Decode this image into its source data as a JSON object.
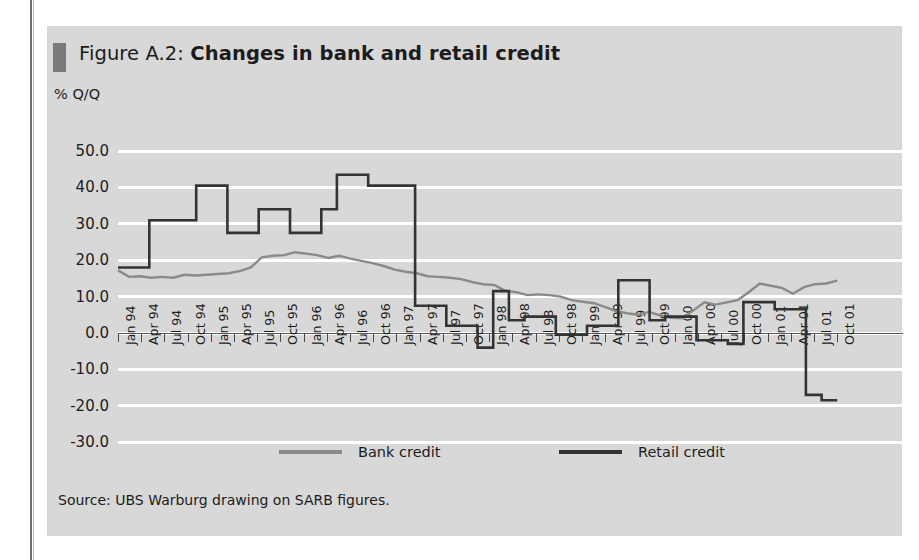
{
  "figure": {
    "label": "Figure A.2:",
    "title": "Changes in bank and retail credit",
    "y_unit": "% Q/Q",
    "source": "Source: UBS Warburg drawing on SARB figures.",
    "accent_bar_color": "#7a7a7a",
    "panel_bg": "#d8d8d8"
  },
  "legend": {
    "position": "bottom-center",
    "items": [
      {
        "label": "Bank credit",
        "color": "#8a8a8a"
      },
      {
        "label": "Retail credit",
        "color": "#333333"
      }
    ]
  },
  "chart_data": {
    "type": "line",
    "title": "Changes in bank and retail credit",
    "xlabel": "",
    "ylabel": "% Q/Q",
    "ylim": [
      -30,
      50
    ],
    "yticks": [
      "50.0",
      "40.0",
      "30.0",
      "20.0",
      "10.0",
      "0.0",
      "-10.0",
      "-20.0",
      "-30.0"
    ],
    "ytick_values": [
      50,
      40,
      30,
      20,
      10,
      0,
      -10,
      -20,
      -30
    ],
    "grid": true,
    "grid_color": "#ffffff",
    "categories": [
      "Jan 94",
      "Apr 94",
      "Jul 94",
      "Oct 94",
      "Jan 95",
      "Apr 95",
      "Jul 95",
      "Oct 95",
      "Jan 96",
      "Apr 96",
      "Jul 96",
      "Oct 96",
      "Jan 97",
      "Apr 97",
      "Jul 97",
      "Oct 97",
      "Jan 98",
      "Apr 98",
      "Jul 98",
      "Oct 98",
      "Jan 99",
      "Apr 99",
      "Jul 99",
      "Oct 99",
      "Jan 00",
      "Apr 00",
      "Jul 00",
      "Oct 00",
      "Jan 01",
      "Apr 01",
      "Jul 01",
      "Oct 01"
    ],
    "series": [
      {
        "name": "Bank credit",
        "color": "#8a8a8a",
        "values": [
          17.0,
          15.5,
          15.0,
          15.8,
          16.0,
          17.0,
          21.5,
          22.0,
          21.0,
          20.5,
          19.5,
          17.5,
          16.0,
          14.5,
          13.8,
          11.5,
          11.0,
          10.5,
          10.0,
          9.0,
          7.5,
          6.0,
          5.5,
          4.5,
          4.0,
          6.5,
          9.5,
          11.0,
          13.5,
          12.0,
          13.5,
          14.5
        ]
      },
      {
        "name": "Retail credit",
        "color": "#333333",
        "values": [
          18.0,
          18.0,
          31.0,
          31.0,
          40.5,
          27.5,
          27.5,
          27.5,
          34.0,
          34.0,
          27.5,
          34.0,
          43.5,
          40.5,
          40.5,
          40.5,
          20.5,
          7.5,
          2.0,
          2.0,
          -4.0,
          -4.0,
          11.5,
          11.5,
          3.5,
          4.5,
          4.5,
          -0.5,
          -0.5,
          2.0,
          2.0,
          2.0
        ]
      }
    ],
    "series_note": "Both lines are plotted stepwise over 32 quarterly observations from Jan 94 to Oct 01; retail credit falls sharply to about -18 at the end of 2001."
  },
  "retail_path": [
    [
      0,
      18.0
    ],
    [
      1,
      18.0
    ],
    [
      2,
      31.0
    ],
    [
      3,
      31.0
    ],
    [
      4,
      31.0
    ],
    [
      5,
      40.5
    ],
    [
      6,
      40.5
    ],
    [
      7,
      27.5
    ],
    [
      8,
      27.5
    ],
    [
      9,
      34.0
    ],
    [
      10,
      34.0
    ],
    [
      11,
      27.5
    ],
    [
      12,
      27.5
    ],
    [
      13,
      34.0
    ],
    [
      14,
      43.5
    ],
    [
      15,
      43.5
    ],
    [
      16,
      40.5
    ],
    [
      17,
      40.5
    ],
    [
      18,
      40.5
    ],
    [
      19,
      7.5
    ],
    [
      20,
      7.5
    ],
    [
      21,
      2.0
    ],
    [
      22,
      2.0
    ],
    [
      23,
      -4.0
    ],
    [
      24,
      11.5
    ],
    [
      25,
      3.5
    ],
    [
      26,
      4.5
    ],
    [
      27,
      4.5
    ],
    [
      28,
      -0.5
    ],
    [
      29,
      -0.5
    ],
    [
      30,
      2.0
    ],
    [
      31,
      2.0
    ],
    [
      32,
      14.5
    ],
    [
      33,
      14.5
    ],
    [
      34,
      3.5
    ],
    [
      35,
      4.5
    ],
    [
      36,
      4.5
    ],
    [
      37,
      -2.0
    ],
    [
      38,
      -2.0
    ],
    [
      39,
      -3.0
    ],
    [
      40,
      8.5
    ],
    [
      41,
      8.5
    ],
    [
      42,
      6.5
    ],
    [
      43,
      6.5
    ],
    [
      44,
      -17.0
    ],
    [
      45,
      -18.5
    ],
    [
      46,
      -18.5
    ]
  ],
  "bank_path": [
    [
      0,
      17.2
    ],
    [
      1,
      15.4
    ],
    [
      2,
      15.6
    ],
    [
      3,
      15.2
    ],
    [
      4,
      15.4
    ],
    [
      5,
      15.2
    ],
    [
      6,
      16.0
    ],
    [
      7,
      15.8
    ],
    [
      8,
      16.0
    ],
    [
      9,
      16.2
    ],
    [
      10,
      16.4
    ],
    [
      11,
      17.0
    ],
    [
      12,
      18.0
    ],
    [
      13,
      20.8
    ],
    [
      14,
      21.2
    ],
    [
      15,
      21.4
    ],
    [
      16,
      22.2
    ],
    [
      17,
      21.8
    ],
    [
      18,
      21.4
    ],
    [
      19,
      20.6
    ],
    [
      20,
      21.2
    ],
    [
      21,
      20.4
    ],
    [
      22,
      19.8
    ],
    [
      23,
      19.2
    ],
    [
      24,
      18.4
    ],
    [
      25,
      17.4
    ],
    [
      26,
      16.8
    ],
    [
      27,
      16.4
    ],
    [
      28,
      15.6
    ],
    [
      29,
      15.4
    ],
    [
      30,
      15.2
    ],
    [
      31,
      14.8
    ],
    [
      32,
      14.0
    ],
    [
      33,
      13.4
    ],
    [
      34,
      13.2
    ],
    [
      35,
      11.6
    ],
    [
      36,
      11.2
    ],
    [
      37,
      10.4
    ],
    [
      38,
      10.6
    ],
    [
      39,
      10.4
    ],
    [
      40,
      10.0
    ],
    [
      41,
      9.0
    ],
    [
      42,
      8.6
    ],
    [
      43,
      8.2
    ],
    [
      44,
      7.2
    ],
    [
      45,
      6.0
    ],
    [
      46,
      5.4
    ],
    [
      47,
      5.0
    ],
    [
      48,
      5.8
    ],
    [
      49,
      4.8
    ],
    [
      50,
      4.2
    ],
    [
      51,
      4.0
    ],
    [
      52,
      6.2
    ],
    [
      53,
      8.4
    ],
    [
      54,
      7.8
    ],
    [
      55,
      8.4
    ],
    [
      56,
      9.0
    ],
    [
      57,
      11.2
    ],
    [
      58,
      13.6
    ],
    [
      59,
      13.0
    ],
    [
      60,
      12.4
    ],
    [
      61,
      10.8
    ],
    [
      62,
      12.6
    ],
    [
      63,
      13.4
    ],
    [
      64,
      13.6
    ],
    [
      65,
      14.4
    ]
  ]
}
